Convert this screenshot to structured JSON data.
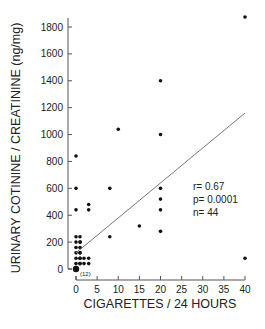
{
  "chart_data": {
    "type": "scatter",
    "title": "",
    "xlabel": "CIGARETTES / 24 HOURS",
    "ylabel": "URINARY COTININE / CREATININE (ng/mg)",
    "xlim": [
      0,
      40
    ],
    "ylim": [
      0,
      1800
    ],
    "xticks": [
      0,
      5,
      10,
      15,
      20,
      25,
      30,
      35,
      40
    ],
    "yticks": [
      0,
      200,
      400,
      600,
      800,
      1000,
      1200,
      1400,
      1600,
      1800
    ],
    "grid": false,
    "points": [
      {
        "x": 40,
        "y": 1880
      },
      {
        "x": 40,
        "y": 80
      },
      {
        "x": 20,
        "y": 1400
      },
      {
        "x": 20,
        "y": 1000
      },
      {
        "x": 20,
        "y": 600
      },
      {
        "x": 20,
        "y": 520
      },
      {
        "x": 20,
        "y": 440
      },
      {
        "x": 20,
        "y": 280
      },
      {
        "x": 15,
        "y": 320
      },
      {
        "x": 10,
        "y": 1040
      },
      {
        "x": 8,
        "y": 600
      },
      {
        "x": 8,
        "y": 240
      },
      {
        "x": 3,
        "y": 480
      },
      {
        "x": 3,
        "y": 440
      },
      {
        "x": 3,
        "y": 80
      },
      {
        "x": 3,
        "y": 40
      },
      {
        "x": 1,
        "y": 200
      },
      {
        "x": 0,
        "y": 840
      },
      {
        "x": 0,
        "y": 600
      },
      {
        "x": 0,
        "y": 440
      },
      {
        "x": 0,
        "y": 240
      },
      {
        "x": 0,
        "y": 200
      },
      {
        "x": 0,
        "y": 160
      },
      {
        "x": 0,
        "y": 120
      },
      {
        "x": 0,
        "y": 120
      },
      {
        "x": 0,
        "y": 80
      },
      {
        "x": 0,
        "y": 80
      },
      {
        "x": 0,
        "y": 80
      },
      {
        "x": 0,
        "y": 40
      },
      {
        "x": 0,
        "y": 40
      },
      {
        "x": 0,
        "y": 40
      },
      {
        "x": 0,
        "y": 0,
        "count": 12,
        "label": "(12)"
      }
    ],
    "regression_line": {
      "x0": 0,
      "y0": 120,
      "x1": 40,
      "y1": 1160
    },
    "annotations": [
      "r= 0.67",
      "p= 0.0001",
      "n= 44"
    ]
  },
  "labels": {
    "xlabel": "CIGARETTES / 24 HOURS",
    "ylabel": "URINARY COTININE / CREATININE (ng/mg)",
    "stat_r": "r= 0.67",
    "stat_p": "p= 0.0001",
    "stat_n": "n= 44",
    "origin_count": "(12)"
  }
}
